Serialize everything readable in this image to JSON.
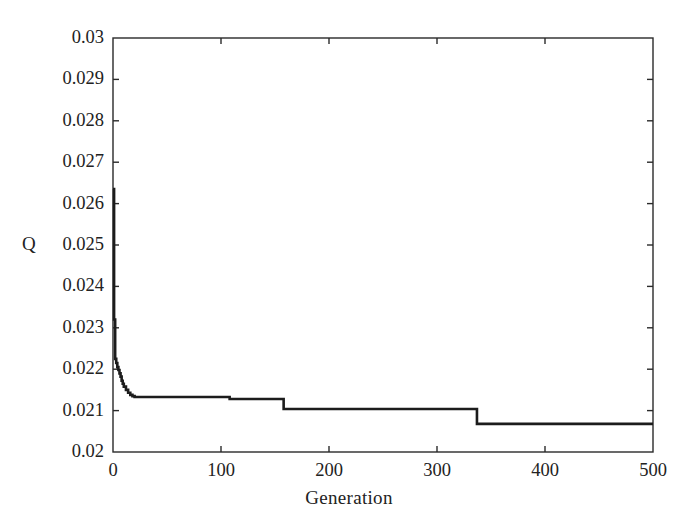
{
  "chart_data": {
    "type": "line",
    "title": "",
    "xlabel": "Generation",
    "ylabel": "Q",
    "xlim": [
      0,
      500
    ],
    "ylim": [
      0.02,
      0.03
    ],
    "grid": false,
    "legend": null,
    "line_color": "#1c1c1c",
    "x_ticks": [
      0,
      100,
      200,
      300,
      400,
      500
    ],
    "x_tick_labels": [
      "0",
      "100",
      "200",
      "300",
      "400",
      "500"
    ],
    "y_ticks": [
      0.02,
      0.021,
      0.022,
      0.023,
      0.024,
      0.025,
      0.026,
      0.027,
      0.028,
      0.029,
      0.03
    ],
    "y_tick_labels": [
      "0.02",
      "0.021",
      "0.022",
      "0.023",
      "0.024",
      "0.025",
      "0.026",
      "0.027",
      "0.028",
      "0.029",
      "0.03"
    ],
    "series": [
      {
        "name": "best-fitness",
        "step": "post",
        "x": [
          0,
          1,
          2,
          3,
          4,
          5,
          6,
          7,
          8,
          9,
          10,
          12,
          14,
          16,
          18,
          20,
          108,
          158,
          337,
          500
        ],
        "y": [
          0.02635,
          0.0232,
          0.02225,
          0.02215,
          0.02205,
          0.02198,
          0.0219,
          0.02182,
          0.02172,
          0.02165,
          0.02158,
          0.0215,
          0.02143,
          0.02138,
          0.02135,
          0.02133,
          0.02128,
          0.02104,
          0.02068,
          0.02068
        ]
      }
    ]
  },
  "axes": {
    "y_title": "Q",
    "x_title": "Generation"
  }
}
